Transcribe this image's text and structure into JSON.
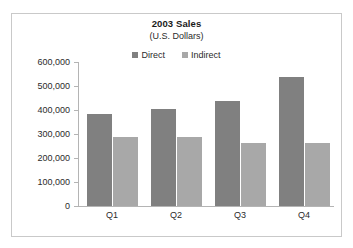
{
  "chart_data": {
    "type": "bar",
    "title": "2003 Sales",
    "subtitle": "(U.S. Dollars)",
    "xlabel": "",
    "ylabel": "",
    "categories": [
      "Q1",
      "Q2",
      "Q3",
      "Q4"
    ],
    "series": [
      {
        "name": "Direct",
        "color": "#808080",
        "values": [
          383000,
          404000,
          438000,
          537000
        ]
      },
      {
        "name": "Indirect",
        "color": "#a8a8a8",
        "values": [
          287000,
          287000,
          262000,
          262000
        ]
      }
    ],
    "ylim": [
      0,
      600000
    ],
    "ytick_values": [
      0,
      100000,
      200000,
      300000,
      400000,
      500000,
      600000
    ],
    "ytick_labels": [
      "0",
      "100,000",
      "200,000",
      "300,000",
      "400,000",
      "500,000",
      "600,000"
    ],
    "grid": false,
    "legend_position": "top-center",
    "legend_entries": [
      "Direct",
      "Indirect"
    ]
  },
  "frame": {
    "border_color": "#c9c9c9",
    "background": "#ffffff"
  }
}
